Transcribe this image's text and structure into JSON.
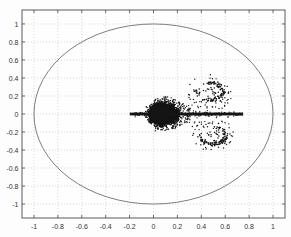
{
  "window": {
    "width": 291,
    "height": 237,
    "title": ""
  },
  "colors": {
    "background": "#fdfdfd",
    "plot_background": "#fefefe",
    "axis_border": "#5a5a5a",
    "grid": "#c2c2c2",
    "tick": "#4a4a4a",
    "tick_label": "#333333",
    "circle": "#6f6f6f",
    "points": "#141414"
  },
  "chart_data": {
    "type": "scatter",
    "title": "",
    "xlabel": "",
    "ylabel": "",
    "xlim": [
      -1.1,
      1.1
    ],
    "ylim": [
      -1.155,
      1.155
    ],
    "xticks": [
      -1,
      -0.8,
      -0.6,
      -0.4,
      -0.2,
      0,
      0.2,
      0.4,
      0.6,
      0.8,
      1
    ],
    "yticks": [
      -1,
      -0.8,
      -0.6,
      -0.4,
      -0.2,
      0,
      0.2,
      0.4,
      0.6,
      0.8,
      1
    ],
    "xtick_labels": [
      "-1",
      "-0.8",
      "-0.6",
      "-0.4",
      "-0.2",
      "0",
      "0.2",
      "0.4",
      "0.6",
      "0.8",
      "1"
    ],
    "ytick_labels": [
      "-1",
      "-0.8",
      "-0.6",
      "-0.4",
      "-0.2",
      "0",
      "0.2",
      "0.4",
      "0.6",
      "0.8",
      "1"
    ],
    "grid_style": "dotted",
    "legend": null,
    "unit_circle": {
      "cx": 0,
      "cy": 0,
      "r": 1
    },
    "spectrum": {
      "seed": 20240601,
      "real_axis_segment": {
        "x_start": -0.197,
        "x_end": 0.75,
        "y": 0,
        "thickness_px": 2.8
      },
      "axis_beads": {
        "x_start": 0.2,
        "x_end": 0.745,
        "step": 0.031,
        "jitter": 0.007,
        "radius_px": 1.25
      },
      "core_blob": {
        "outline_top": [
          [
            -0.055,
            0
          ],
          [
            -0.025,
            0.075
          ],
          [
            0.02,
            0.115
          ],
          [
            0.07,
            0.127
          ],
          [
            0.125,
            0.112
          ],
          [
            0.165,
            0.085
          ],
          [
            0.195,
            0.045
          ],
          [
            0.205,
            0
          ]
        ],
        "edge_specks": 340,
        "edge_jitter": 0.013
      },
      "fringe": {
        "bands": [
          0.135,
          0.17,
          0.205,
          0.245,
          0.285
        ],
        "band_weights": [
          0.28,
          0.24,
          0.2,
          0.16,
          0.12
        ],
        "y_max": 0.185,
        "over_blob_x_range": [
          0.0,
          0.13
        ],
        "over_blob_y_range": [
          0.12,
          0.19
        ],
        "points": 270
      },
      "wings": [
        {
          "cx": 0.475,
          "cy": 0.25,
          "rx": 0.12,
          "ry": 0.1,
          "ring_points": 100,
          "inner_points": 16,
          "outlier_points": 26
        },
        {
          "cx": 0.495,
          "cy": -0.24,
          "rx": 0.115,
          "ry": 0.1,
          "ring_points": 100,
          "inner_points": 16,
          "outlier_points": 26
        }
      ],
      "sparse_band": {
        "x_range": [
          0.3,
          0.64
        ],
        "y_abs_range": [
          0.03,
          0.17
        ],
        "points": 46
      },
      "axis_specks": {
        "x_range": [
          -0.197,
          0.75
        ],
        "y_jitter": 0.014,
        "points": 170
      }
    }
  }
}
